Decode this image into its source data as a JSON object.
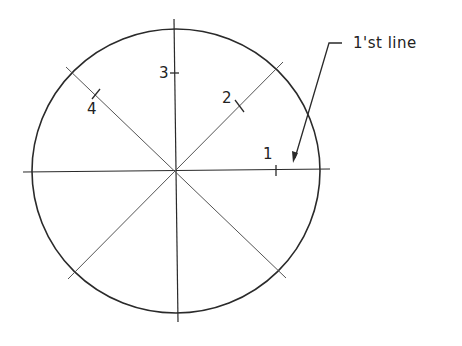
{
  "diagram": {
    "type": "circle-divided-into-8-sectors",
    "colors": {
      "stroke": "#2a2a2a",
      "thin_stroke": "#555555",
      "background": "#ffffff"
    },
    "circle": {
      "cx": 176,
      "cy": 171,
      "rx": 144,
      "ry": 142
    },
    "center_lines": {
      "horizontal": {
        "x1": 23,
        "y1": 172,
        "x2": 330,
        "y2": 169
      },
      "vertical": {
        "x1": 174,
        "y1": 19,
        "x2": 178,
        "y2": 322
      }
    },
    "diagonals": [
      {
        "x1": 66,
        "y1": 67,
        "x2": 286,
        "y2": 278
      },
      {
        "x1": 283,
        "y1": 62,
        "x2": 68,
        "y2": 279
      }
    ],
    "ticks": [
      {
        "id": "1",
        "x1": 276,
        "y1": 165,
        "x2": 276,
        "y2": 176
      },
      {
        "id": "2",
        "x1": 235,
        "y1": 100,
        "x2": 244,
        "y2": 112
      },
      {
        "id": "3",
        "x1": 170,
        "y1": 73,
        "x2": 179,
        "y2": 73
      },
      {
        "id": "4",
        "x1": 92,
        "y1": 99,
        "x2": 100,
        "y2": 89
      }
    ],
    "labels": [
      {
        "id": "1",
        "text": "1",
        "x": 263,
        "y": 147
      },
      {
        "id": "2",
        "text": "2",
        "x": 222,
        "y": 91
      },
      {
        "id": "3",
        "text": "3",
        "x": 159,
        "y": 66
      },
      {
        "id": "4",
        "text": "4",
        "x": 87,
        "y": 102
      }
    ],
    "leader": {
      "text": "1'st line",
      "text_x": 353,
      "text_y": 36,
      "points": "342,43 329,43 295,158",
      "arrow_tip": {
        "x": 293,
        "y": 163
      }
    }
  }
}
